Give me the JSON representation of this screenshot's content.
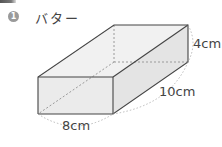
{
  "problem": {
    "number": "1",
    "title": "バター"
  },
  "figure": {
    "shape": "rectangular-prism",
    "dimensions": {
      "height": "4cm",
      "depth": "10cm",
      "width": "8cm"
    }
  },
  "colors": {
    "line": "#444444",
    "hidden_line": "#9a9a9a",
    "face": "#e9e9e9",
    "marker": "#9a9a9a"
  }
}
